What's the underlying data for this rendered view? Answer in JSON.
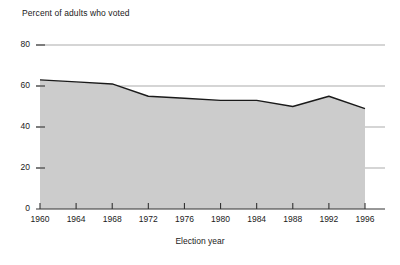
{
  "chart_data": {
    "type": "area",
    "title": "",
    "ylabel": "Percent of adults who voted",
    "xlabel": "Election year",
    "categories": [
      1960,
      1964,
      1968,
      1972,
      1976,
      1980,
      1984,
      1988,
      1992,
      1996
    ],
    "values": [
      63,
      62,
      61,
      55,
      54,
      53,
      53,
      50,
      55,
      49
    ],
    "series": [
      {
        "name": "Percent of adults who voted",
        "values": [
          63,
          62,
          61,
          55,
          54,
          53,
          53,
          50,
          55,
          49
        ]
      }
    ],
    "x_tick_labels": [
      "1960",
      "1964",
      "1968",
      "1972",
      "1976",
      "1980",
      "1984",
      "1988",
      "1992",
      "1996"
    ],
    "y_tick_labels": [
      "0",
      "20",
      "40",
      "60",
      "80"
    ],
    "y_ticks": [
      0,
      20,
      40,
      60,
      80
    ],
    "ylim": [
      0,
      80
    ],
    "xlim": [
      1960,
      1996
    ],
    "grid": true,
    "legend": false,
    "fill_color": "#cccccc",
    "line_color": "#1a1a1a",
    "grid_color": "#888888",
    "axis_color": "#333333"
  },
  "axes": {
    "y_title": "Percent of adults who voted",
    "x_title": "Election year"
  }
}
